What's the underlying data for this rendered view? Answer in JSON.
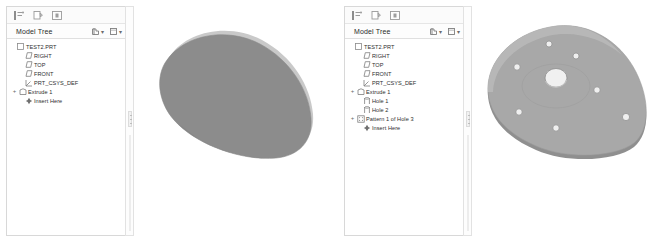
{
  "app": {
    "panel_title": "Model Tree",
    "background": "#ffffff"
  },
  "toolbar": {
    "buttons": [
      {
        "name": "show-tree-filters-icon",
        "label": ""
      },
      {
        "name": "copy-icon",
        "label": ""
      },
      {
        "name": "insert-mode-icon",
        "label": ""
      }
    ]
  },
  "header_tools": [
    {
      "name": "settings-dropdown",
      "caret": "▾"
    },
    {
      "name": "display-dropdown",
      "caret": "▾"
    }
  ],
  "panels": [
    {
      "id": "left",
      "title": "Model Tree",
      "tree": [
        {
          "label": "TEST2.PRT",
          "icon": "part-icon",
          "expander": "",
          "depth": 0
        },
        {
          "label": "RIGHT",
          "icon": "datum-plane-icon",
          "expander": "",
          "depth": 1
        },
        {
          "label": "TOP",
          "icon": "datum-plane-icon",
          "expander": "",
          "depth": 1
        },
        {
          "label": "FRONT",
          "icon": "datum-plane-icon",
          "expander": "",
          "depth": 1
        },
        {
          "label": "PRT_CSYS_DEF",
          "icon": "coord-system-icon",
          "expander": "",
          "depth": 1
        },
        {
          "label": "Extrude 1",
          "icon": "extrude-icon",
          "expander": "+",
          "depth": 1
        },
        {
          "label": "Insert Here",
          "icon": "insert-here-icon",
          "expander": "",
          "depth": 1
        }
      ]
    },
    {
      "id": "right",
      "title": "Model Tree",
      "tree": [
        {
          "label": "TEST2.PRT",
          "icon": "part-icon",
          "expander": "",
          "depth": 0
        },
        {
          "label": "RIGHT",
          "icon": "datum-plane-icon",
          "expander": "",
          "depth": 1
        },
        {
          "label": "TOP",
          "icon": "datum-plane-icon",
          "expander": "",
          "depth": 1
        },
        {
          "label": "FRONT",
          "icon": "datum-plane-icon",
          "expander": "",
          "depth": 1
        },
        {
          "label": "PRT_CSYS_DEF",
          "icon": "coord-system-icon",
          "expander": "",
          "depth": 1
        },
        {
          "label": "Extrude 1",
          "icon": "extrude-icon",
          "expander": "+",
          "depth": 1
        },
        {
          "label": "Hole 1",
          "icon": "hole-icon",
          "expander": "",
          "depth": 1
        },
        {
          "label": "Hole 2",
          "icon": "hole-icon",
          "expander": "",
          "depth": 1
        },
        {
          "label": "Pattern 1 of Hole 3",
          "icon": "pattern-icon",
          "expander": "+",
          "depth": 1
        },
        {
          "label": "Insert Here",
          "icon": "insert-here-icon",
          "expander": "",
          "depth": 1
        }
      ]
    }
  ],
  "models": [
    {
      "id": "extrude-solid",
      "name": "teardrop-extrusion",
      "face_color": "#8c8c8c",
      "edge_color": "#c9c9c9",
      "outline_color": "#9a9a9a",
      "holes": []
    },
    {
      "id": "patterned-plate",
      "name": "patterned-plate-with-holes",
      "face_color": "#a8a8a8",
      "edge_color": "#d0d0d0",
      "outline_color": "#8f8f8f",
      "center_hole_color": "#f2f2f2",
      "holes": [
        {
          "cx": 75,
          "cy": 44,
          "r": 3.0
        },
        {
          "cx": 102,
          "cy": 56,
          "r": 3.0
        },
        {
          "cx": 43,
          "cy": 67,
          "r": 3.2
        },
        {
          "cx": 123,
          "cy": 90,
          "r": 3.2
        },
        {
          "cx": 45,
          "cy": 112,
          "r": 3.2
        },
        {
          "cx": 152,
          "cy": 117,
          "r": 3.4
        },
        {
          "cx": 82,
          "cy": 128,
          "r": 3.2
        }
      ],
      "center_hole": {
        "cx": 82,
        "cy": 78,
        "r": 10
      }
    }
  ]
}
